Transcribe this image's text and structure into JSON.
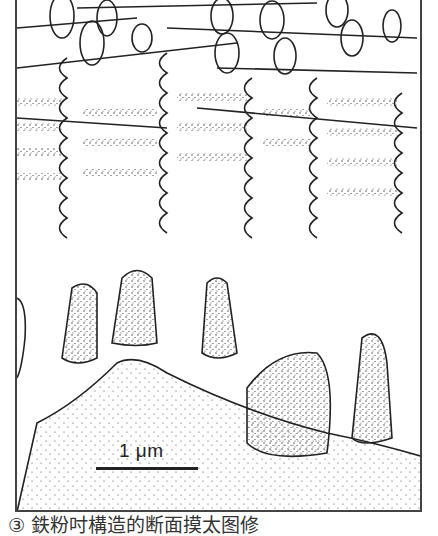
{
  "figure": {
    "type": "scientific-line-drawing",
    "scale_bar": {
      "label": "1 μm"
    },
    "caption": "③ 鉄粉吋構造的断面摸太图修",
    "colors": {
      "line": "#222222",
      "stipple": "#333333",
      "background": "#ffffff",
      "frame": "#444444"
    }
  }
}
